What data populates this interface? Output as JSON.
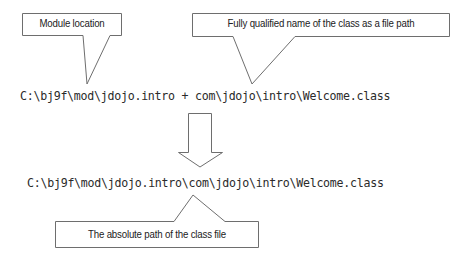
{
  "diagram": {
    "callouts": [
      {
        "id": "module-location",
        "label": "Module location"
      },
      {
        "id": "fully-qualified-name",
        "label": "Fully qualified name of the class as a file path"
      },
      {
        "id": "absolute-path",
        "label": "The absolute path of the class file"
      }
    ],
    "expression": {
      "module_path": "C:\\bj9f\\mod\\jdojo.intro",
      "operator": "+",
      "class_path": "com\\jdojo\\intro\\Welcome.class",
      "full_line": "C:\\bj9f\\mod\\jdojo.intro + com\\jdojo\\intro\\Welcome.class"
    },
    "result": {
      "full_line": "C:\\bj9f\\mod\\jdojo.intro\\com\\jdojo\\intro\\Welcome.class"
    },
    "arrow": {
      "direction": "down",
      "style": "hollow"
    },
    "colors": {
      "stroke": "#6e6e6e",
      "text": "#222222",
      "background": "#ffffff"
    }
  }
}
